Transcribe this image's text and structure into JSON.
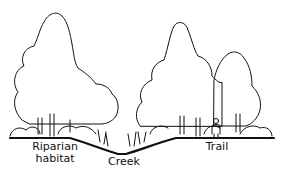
{
  "diagram": {
    "type": "cross-section illustration",
    "labels": {
      "riparian_line1": "Riparian",
      "riparian_line2": "habitat",
      "creek": "Creek",
      "trail": "Trail"
    },
    "colors": {
      "ink": "#111111",
      "background": "#ffffff"
    }
  }
}
